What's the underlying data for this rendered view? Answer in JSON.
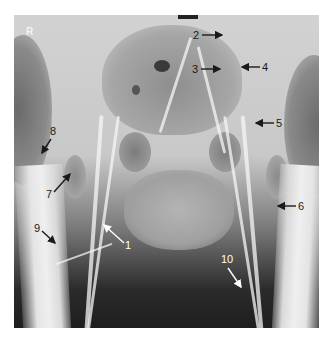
{
  "figure": {
    "type": "pelvic-angiogram-radiograph",
    "side_marker": "R",
    "annotations": [
      {
        "label": "1",
        "color": "white",
        "label_x": 125,
        "label_y": 245
      },
      {
        "label": "2",
        "color": "black",
        "label_x": 193,
        "label_y": 30
      },
      {
        "label": "3",
        "color": "black",
        "label_x": 192,
        "label_y": 64
      },
      {
        "label": "4",
        "color": "black",
        "label_x": 262,
        "label_y": 64
      },
      {
        "label": "5",
        "color": "black",
        "label_x": 276,
        "label_y": 119
      },
      {
        "label": "6",
        "color": "black",
        "label_x": 298,
        "label_y": 201
      },
      {
        "label": "7",
        "color": "black",
        "label_x": 46,
        "label_y": 187
      },
      {
        "label": "8",
        "color": "black",
        "label_x": 51,
        "label_y": 126
      },
      {
        "label": "9",
        "color": "black",
        "label_x": 34,
        "label_y": 224
      },
      {
        "label": "10",
        "color": "white",
        "label_x": 221,
        "label_y": 255
      }
    ],
    "colors": {
      "arrow_dark": "#1a1a1a",
      "arrow_light": "#ffffff",
      "background": "#ffffff"
    }
  }
}
